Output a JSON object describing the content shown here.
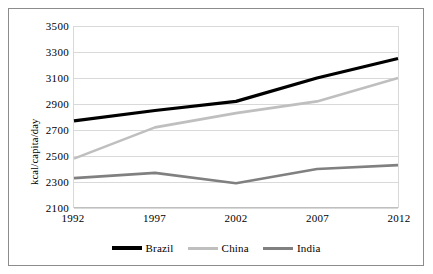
{
  "chart_data": {
    "type": "line",
    "title": "",
    "subtitle": "",
    "xlabel": "",
    "ylabel": "kcal/capita/day",
    "categories": [
      "1992",
      "1997",
      "2002",
      "2007",
      "2012"
    ],
    "x": [
      1992,
      1997,
      2002,
      2007,
      2012
    ],
    "series": [
      {
        "name": "Brazil",
        "color": "#000000",
        "line_width": 3.2,
        "values": [
          2770,
          2850,
          2920,
          3100,
          3250
        ]
      },
      {
        "name": "China",
        "color": "#bfbfbf",
        "line_width": 2.6,
        "values": [
          2480,
          2720,
          2830,
          2920,
          3100
        ]
      },
      {
        "name": "India",
        "color": "#808080",
        "line_width": 2.6,
        "values": [
          2330,
          2370,
          2290,
          2400,
          2430
        ]
      }
    ],
    "ylim": [
      2100,
      3500
    ],
    "ytick_values": [
      2100,
      2300,
      2500,
      2700,
      2900,
      3100,
      3300,
      3500
    ],
    "ytick_labels": [
      "2100",
      "2300",
      "2500",
      "2700",
      "2900",
      "3100",
      "3300",
      "3500"
    ],
    "grid": "horizontal",
    "legend_position": "bottom",
    "annotations": []
  },
  "figure": {
    "border_color": "#8c8c8c",
    "grid_color": "#d9d9d9",
    "background": "#ffffff"
  },
  "legend": {
    "entries": [
      {
        "label": "Brazil",
        "color": "#000000",
        "line_width": 4
      },
      {
        "label": "China",
        "color": "#bfbfbf",
        "line_width": 3
      },
      {
        "label": "India",
        "color": "#808080",
        "line_width": 3
      }
    ]
  }
}
